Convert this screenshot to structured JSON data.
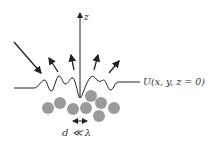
{
  "diagram": {
    "axis": {
      "label": "z"
    },
    "surface": {
      "label": "U(x, y, z = 0)"
    },
    "spacing": {
      "label": "d ≪ λ"
    },
    "incident_arrows": 1,
    "scattered_arrows": 4,
    "particles": 8,
    "colors": {
      "line": "#222222",
      "particle": "#9a9a9a",
      "text": "#333333"
    }
  }
}
